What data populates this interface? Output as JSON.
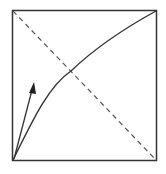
{
  "diagram": {
    "type": "square-plot-with-curve",
    "colors": {
      "background": "#ffffff",
      "frame": "#333333",
      "curve": "#333333",
      "diagonal": "#555555",
      "arrow": "#333333"
    },
    "elements": [
      {
        "name": "frame",
        "shape": "square"
      },
      {
        "name": "diagonal",
        "style": "dashed",
        "from": "top-left",
        "to": "bottom-right"
      },
      {
        "name": "curve",
        "style": "solid",
        "from": "bottom-left",
        "to": "top-right",
        "shape": "concave"
      },
      {
        "name": "arrow",
        "style": "solid",
        "from": "bottom-left",
        "direction": "up-right steep"
      }
    ]
  }
}
